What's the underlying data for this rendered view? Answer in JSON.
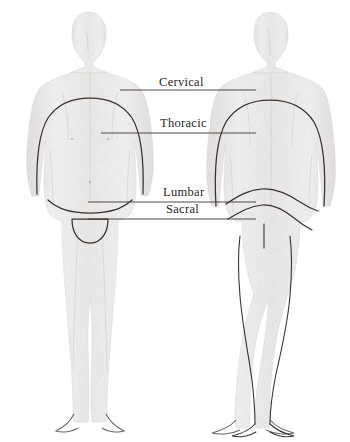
{
  "figure": {
    "views": [
      {
        "name": "anterior-view",
        "description": "Front view of human body"
      },
      {
        "name": "posterior-view",
        "description": "Back view of human body"
      }
    ],
    "style": {
      "background_color": "#ffffff",
      "body_fill": "#f4f3f2",
      "body_shade": "#e3e1e0",
      "outline_color": "#3a3432",
      "leader_color": "#3c3633",
      "label_color": "#241f1d"
    }
  },
  "labels": [
    {
      "id": "cervical",
      "text": "Cervical"
    },
    {
      "id": "thoracic",
      "text": "Thoracic"
    },
    {
      "id": "lumbar",
      "text": "Lumbar"
    },
    {
      "id": "sacral",
      "text": "Sacral"
    }
  ],
  "leader_lines": [
    {
      "id": "cervical-leader",
      "y": 90,
      "x_start": 120,
      "x_end": 256
    },
    {
      "id": "thoracic-leader",
      "y": 133,
      "x_start": 101,
      "x_end": 256
    },
    {
      "id": "lumbar-leader",
      "y": 202,
      "x_start": 88,
      "x_end": 256
    },
    {
      "id": "sacral-leader",
      "y": 219,
      "x_start": 88,
      "x_end": 256
    }
  ]
}
